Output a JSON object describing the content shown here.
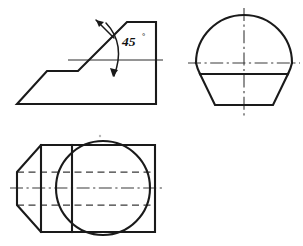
{
  "document": {
    "title": "Orthographic Projection Drawing",
    "type": "engineering-drawing",
    "background_color": "#ffffff",
    "line_color": "#1a1a1a",
    "hidden_line_color": "#3a3a3a",
    "center_line_color": "#3a3a3a",
    "width_px": 303,
    "height_px": 246
  },
  "annotations": {
    "angle_dimension": {
      "value": "45",
      "unit_symbol": "°",
      "full_label": "45°",
      "x": 124,
      "y": 45
    }
  },
  "views": {
    "front_view": {
      "name": "front-view",
      "description": "Profile with 45 degree chamfer and stepped base",
      "outline_points": "17,104 47,71 78,71 127,22 156,22 156,104",
      "reference_line": {
        "x1": 68,
        "y1": 60,
        "x2": 163,
        "y2": 60
      },
      "vertical_edge": {
        "x1": 156,
        "y1": 22,
        "x2": 156,
        "y2": 104
      }
    },
    "top_right_view": {
      "name": "top-right-view",
      "description": "Circular upper profile above trapezoid base",
      "circle": {
        "cx": 244,
        "cy": 63,
        "r": 48
      },
      "trapezoid_points": "200,74 288,74 273,105 215,105",
      "chord_line": {
        "x1": 200,
        "y1": 74,
        "x2": 288,
        "y2": 74
      },
      "vertical_center_line": {
        "x1": 244,
        "y1": 8,
        "x2": 244,
        "y2": 118
      },
      "horizontal_center_line": {
        "x1": 188,
        "y1": 63,
        "x2": 300,
        "y2": 63
      }
    },
    "bottom_view": {
      "name": "bottom-view",
      "description": "Plan view with tapered nose, circular boss and hidden lines",
      "outline_points": "17,172 41,145 155,145 155,232 41,232 17,205",
      "vertical_rib_1": {
        "x1": 41,
        "y1": 145,
        "x2": 41,
        "y2": 232
      },
      "vertical_rib_2": {
        "x1": 72,
        "y1": 145,
        "x2": 72,
        "y2": 232
      },
      "boss_circle": {
        "cx": 103,
        "cy": 188,
        "r": 47
      },
      "hidden_line_upper": {
        "x1": 17,
        "y1": 172,
        "x2": 155,
        "y2": 172
      },
      "hidden_line_lower": {
        "x1": 17,
        "y1": 205,
        "x2": 155,
        "y2": 205
      },
      "horizontal_center_line": {
        "x1": 10,
        "y1": 188,
        "x2": 162,
        "y2": 188
      }
    }
  }
}
